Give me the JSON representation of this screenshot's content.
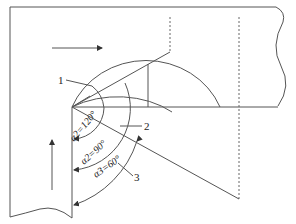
{
  "diagram": {
    "type": "pipe-elbow-angle-diagram",
    "labels": {
      "callout_1": "1",
      "callout_2": "2",
      "callout_3": "3"
    },
    "angles": [
      {
        "symbol": "α",
        "subscript": "2",
        "value": "120°",
        "text": "α2=120°"
      },
      {
        "symbol": "α",
        "subscript": "2",
        "value": "90°",
        "text": "α2=90°"
      },
      {
        "symbol": "α",
        "subscript": "3",
        "value": "60°",
        "text": "α3=60°"
      }
    ],
    "flow_arrows": [
      {
        "direction": "right",
        "location": "horizontal-branch"
      },
      {
        "direction": "up",
        "location": "vertical-branch"
      }
    ],
    "colors": {
      "line": "#555555",
      "background": "#ffffff"
    }
  }
}
